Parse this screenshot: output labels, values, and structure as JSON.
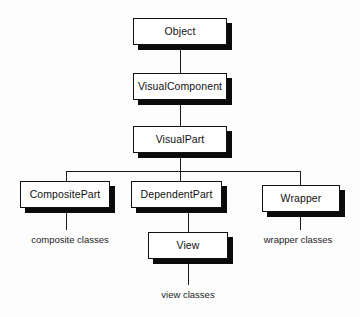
{
  "diagram": {
    "type": "class-hierarchy",
    "background_color": "#fdfdfd",
    "box_fill_color": "#ffffff",
    "box_border_color": "#111111",
    "shadow_color": "#0b0b0b",
    "line_color": "#1a1a1a",
    "nodes": [
      {
        "id": "object",
        "label": "Object",
        "x": 133,
        "y": 18,
        "w": 94,
        "h": 27
      },
      {
        "id": "visualcomponent",
        "label": "VisualComponent",
        "x": 133,
        "y": 73,
        "w": 94,
        "h": 27
      },
      {
        "id": "visualpart",
        "label": "VisualPart",
        "x": 133,
        "y": 126,
        "w": 94,
        "h": 27
      },
      {
        "id": "compositepart",
        "label": "CompositePart",
        "x": 20,
        "y": 181,
        "w": 90,
        "h": 27
      },
      {
        "id": "dependentpart",
        "label": "DependentPart",
        "x": 131,
        "y": 181,
        "w": 91,
        "h": 27
      },
      {
        "id": "wrapper",
        "label": "Wrapper",
        "x": 262,
        "y": 185,
        "w": 78,
        "h": 27
      },
      {
        "id": "view",
        "label": "View",
        "x": 148,
        "y": 232,
        "w": 80,
        "h": 27
      }
    ],
    "edges": [
      {
        "id": "object-to-visualcomponent",
        "from": "object",
        "to": "visualcomponent"
      },
      {
        "id": "visualcomponent-to-visualpart",
        "from": "visualcomponent",
        "to": "visualpart"
      },
      {
        "id": "visualpart-to-compositepart",
        "from": "visualpart",
        "to": "compositepart"
      },
      {
        "id": "visualpart-to-dependentpart",
        "from": "visualpart",
        "to": "dependentpart"
      },
      {
        "id": "visualpart-to-wrapper",
        "from": "visualpart",
        "to": "wrapper"
      },
      {
        "id": "dependentpart-to-view",
        "from": "dependentpart",
        "to": "view"
      },
      {
        "id": "compositepart-to-caption",
        "from": "compositepart",
        "to": "composite-classes-caption"
      },
      {
        "id": "wrapper-to-caption",
        "from": "wrapper",
        "to": "wrapper-classes-caption"
      },
      {
        "id": "view-to-caption",
        "from": "view",
        "to": "view-classes-caption"
      }
    ],
    "captions": [
      {
        "id": "composite",
        "label": "composite classes",
        "x": 22,
        "y": 234,
        "w": 96
      },
      {
        "id": "wrapper",
        "label": "wrapper classes",
        "x": 252,
        "y": 234,
        "w": 92
      },
      {
        "id": "view",
        "label": "view classes",
        "x": 142,
        "y": 289,
        "w": 92
      }
    ]
  }
}
